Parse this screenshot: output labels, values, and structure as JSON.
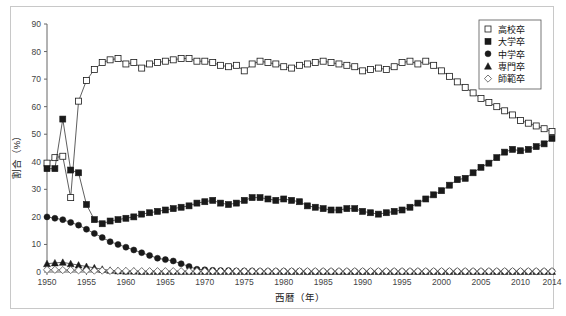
{
  "chart_data": {
    "type": "line",
    "title": "",
    "xlabel": "西暦（年）",
    "ylabel": "割合（%）",
    "xlim": [
      1950,
      2014
    ],
    "ylim": [
      0,
      90
    ],
    "ytick_step": 10,
    "yticks": [
      0,
      10,
      20,
      30,
      40,
      50,
      60,
      70,
      80,
      90
    ],
    "xticks": [
      1950,
      1955,
      1960,
      1965,
      1970,
      1975,
      1980,
      1985,
      1990,
      1995,
      2000,
      2005,
      2010,
      2014
    ],
    "grid": false,
    "legend_position": "top-right",
    "x": [
      1950,
      1951,
      1952,
      1953,
      1954,
      1955,
      1956,
      1957,
      1958,
      1959,
      1960,
      1961,
      1962,
      1963,
      1964,
      1965,
      1966,
      1967,
      1968,
      1969,
      1970,
      1971,
      1972,
      1973,
      1974,
      1975,
      1976,
      1977,
      1978,
      1979,
      1980,
      1981,
      1982,
      1983,
      1984,
      1985,
      1986,
      1987,
      1988,
      1989,
      1990,
      1991,
      1992,
      1993,
      1994,
      1995,
      1996,
      1997,
      1998,
      1999,
      2000,
      2001,
      2002,
      2003,
      2004,
      2005,
      2006,
      2007,
      2008,
      2009,
      2010,
      2011,
      2012,
      2013,
      2014
    ],
    "series": [
      {
        "name": "高校卒",
        "marker": "open-square",
        "values": [
          39.5,
          41.5,
          42.0,
          27.0,
          62.0,
          69.5,
          73.5,
          76.0,
          77.0,
          77.5,
          75.5,
          76.0,
          74.0,
          75.5,
          76.0,
          76.5,
          77.0,
          77.5,
          77.5,
          76.5,
          76.5,
          76.0,
          75.0,
          74.5,
          75.0,
          73.0,
          75.5,
          76.5,
          76.0,
          75.5,
          74.5,
          74.0,
          75.0,
          75.5,
          76.0,
          76.5,
          76.0,
          75.5,
          75.0,
          74.5,
          73.0,
          73.5,
          74.0,
          73.5,
          74.5,
          76.0,
          76.5,
          75.5,
          76.5,
          75.0,
          73.0,
          71.0,
          69.0,
          67.0,
          65.0,
          63.0,
          61.5,
          60.0,
          58.5,
          57.0,
          55.0,
          54.0,
          53.0,
          52.0,
          51.0
        ]
      },
      {
        "name": "大学卒",
        "marker": "filled-square",
        "values": [
          37.5,
          37.5,
          55.5,
          37.0,
          36.0,
          24.5,
          19.0,
          17.5,
          18.5,
          19.0,
          19.5,
          20.0,
          21.0,
          21.5,
          22.0,
          22.5,
          23.0,
          23.5,
          24.0,
          25.0,
          25.5,
          26.0,
          25.0,
          24.5,
          25.0,
          26.0,
          27.0,
          27.0,
          26.5,
          26.0,
          26.5,
          26.0,
          25.5,
          24.0,
          23.5,
          23.0,
          22.5,
          22.5,
          23.0,
          23.0,
          22.0,
          21.5,
          21.0,
          21.5,
          22.0,
          22.5,
          23.5,
          25.0,
          26.5,
          28.0,
          29.5,
          31.5,
          33.5,
          34.0,
          36.0,
          38.0,
          39.5,
          41.5,
          43.5,
          44.5,
          44.0,
          44.5,
          45.5,
          46.5,
          48.5
        ]
      },
      {
        "name": "中学卒",
        "marker": "filled-circle",
        "values": [
          20.0,
          19.5,
          19.0,
          18.0,
          17.0,
          15.5,
          14.0,
          12.5,
          11.0,
          10.0,
          9.0,
          8.0,
          7.0,
          6.0,
          5.0,
          4.5,
          4.0,
          3.0,
          2.0,
          1.0,
          0.8,
          0.6,
          0.5,
          0.5,
          0.4,
          0.4,
          0.4,
          0.3,
          0.3,
          0.3,
          0.3,
          0.3,
          0.3,
          0.2,
          0.2,
          0.2,
          0.2,
          0.2,
          0.2,
          0.2,
          0.2,
          0.2,
          0.2,
          0.2,
          0.2,
          0.2,
          0.2,
          0.2,
          0.2,
          0.2,
          0.2,
          0.2,
          0.2,
          0.2,
          0.2,
          0.2,
          0.2,
          0.2,
          0.2,
          0.2,
          0.2,
          0.2,
          0.2,
          0.2,
          0.2
        ]
      },
      {
        "name": "専門卒",
        "marker": "filled-triangle",
        "values": [
          3.0,
          3.3,
          3.5,
          3.0,
          2.5,
          2.0,
          1.5,
          1.0,
          0.6,
          0.4,
          0.3,
          0.3,
          0.2,
          0.2,
          0.2,
          0.2,
          0.2,
          0.2,
          0.2,
          0.2,
          0.2,
          0.2,
          0.2,
          0.2,
          0.2,
          0.2,
          0.2,
          0.2,
          0.2,
          0.2,
          0.2,
          0.2,
          0.2,
          0.2,
          0.2,
          0.2,
          0.2,
          0.2,
          0.2,
          0.2,
          0.2,
          0.2,
          0.2,
          0.2,
          0.2,
          0.2,
          0.2,
          0.2,
          0.2,
          0.2,
          0.2,
          0.2,
          0.2,
          0.2,
          0.2,
          0.2,
          0.2,
          0.2,
          0.2,
          0.2,
          0.2,
          0.2,
          0.2,
          0.2,
          0.2
        ]
      },
      {
        "name": "師範卒",
        "marker": "open-diamond",
        "values": [
          0.8,
          0.8,
          0.7,
          0.7,
          0.6,
          0.6,
          0.5,
          0.5,
          0.4,
          0.4,
          0.4,
          0.3,
          0.3,
          0.3,
          0.3,
          0.3,
          0.3,
          0.3,
          0.3,
          0.3,
          0.3,
          0.3,
          0.3,
          0.3,
          0.3,
          0.3,
          0.3,
          0.3,
          0.3,
          0.3,
          0.3,
          0.3,
          0.3,
          0.3,
          0.3,
          0.3,
          0.3,
          0.3,
          0.3,
          0.3,
          0.3,
          0.3,
          0.3,
          0.3,
          0.3,
          0.3,
          0.3,
          0.3,
          0.3,
          0.3,
          0.3,
          0.3,
          0.3,
          0.3,
          0.3,
          0.3,
          0.3,
          0.3,
          0.3,
          0.3,
          0.3,
          0.3,
          0.3,
          0.3,
          0.3
        ]
      }
    ]
  },
  "legend": {
    "entries": [
      {
        "label": "高校卒",
        "marker": "open-square"
      },
      {
        "label": "大学卒",
        "marker": "filled-square"
      },
      {
        "label": "中学卒",
        "marker": "filled-circle"
      },
      {
        "label": "専門卒",
        "marker": "filled-triangle"
      },
      {
        "label": "師範卒",
        "marker": "open-diamond"
      }
    ]
  },
  "colors": {
    "ink": "#1a1a1a",
    "axis": "#666666",
    "frame": "#c8c8c8",
    "background": "#ffffff"
  }
}
